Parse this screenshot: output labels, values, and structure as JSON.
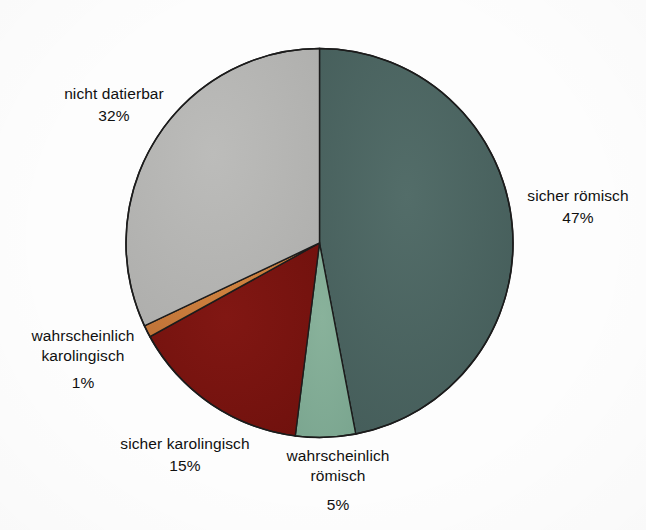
{
  "chart_data": {
    "type": "pie",
    "title": "",
    "subtitle": "",
    "xlabel": "",
    "ylabel": "",
    "legend_position": "none",
    "labels_position": "outside",
    "grid": false,
    "units": "%",
    "start_angle_deg": 0,
    "direction": "clockwise",
    "categories": [
      "sicher römisch",
      "wahrscheinlich römisch",
      "sicher karolingisch",
      "wahrscheinlich karolingisch",
      "nicht datierbar"
    ],
    "values": [
      47,
      5,
      15,
      1,
      32
    ],
    "colors": [
      "#4a6360",
      "#82ac95",
      "#7a1410",
      "#c97b3c",
      "#b5b5b3"
    ],
    "slices": [
      {
        "label": "sicher römisch",
        "value": 47,
        "value_text": "47%",
        "color": "#4a6360",
        "start_deg": 0,
        "end_deg": 169.2
      },
      {
        "label": "wahrscheinlich römisch",
        "value": 5,
        "value_text": "5%",
        "color": "#82ac95",
        "start_deg": 169.2,
        "end_deg": 187.2
      },
      {
        "label": "sicher karolingisch",
        "value": 15,
        "value_text": "15%",
        "color": "#7a1410",
        "start_deg": 187.2,
        "end_deg": 241.2
      },
      {
        "label": "wahrscheinlich karolingisch",
        "value": 1,
        "value_text": "1%",
        "color": "#c97b3c",
        "start_deg": 241.2,
        "end_deg": 244.8
      },
      {
        "label": "nicht datierbar",
        "value": 32,
        "value_text": "32%",
        "color": "#b5b5b3",
        "start_deg": 244.8,
        "end_deg": 360
      }
    ],
    "outline_color": "#1c1c1c",
    "background_color": "#fdfdfd"
  },
  "labels": {
    "sicher_roemisch": {
      "name": "sicher römisch",
      "value": "47%"
    },
    "wahrscheinlich_roemisch": {
      "line1": "wahrscheinlich",
      "line2": "römisch",
      "value": "5%"
    },
    "sicher_karolingisch": {
      "name": "sicher karolingisch",
      "value": "15%"
    },
    "wahrscheinlich_karolingisch": {
      "line1": "wahrscheinlich",
      "line2": "karolingisch",
      "value": "1%"
    },
    "nicht_datierbar": {
      "name": "nicht datierbar",
      "value": "32%"
    }
  }
}
